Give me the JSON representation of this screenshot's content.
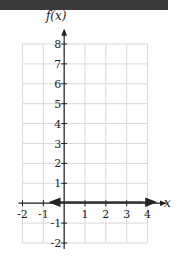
{
  "chart_data": {
    "type": "line",
    "title": "",
    "xlabel": "x",
    "ylabel": "f(x)",
    "xlim": [
      -2,
      4
    ],
    "ylim": [
      -2,
      8
    ],
    "grid": true,
    "x_ticks": [
      "-2",
      "-1",
      "1",
      "2",
      "3",
      "4"
    ],
    "y_ticks": [
      "-2",
      "-1",
      "1",
      "2",
      "3",
      "4",
      "5",
      "6",
      "7",
      "8"
    ],
    "series": [
      {
        "name": "f(x)",
        "function": "4*(0.3)^x",
        "x": [
          -0.7,
          -0.5,
          -0.33,
          -0.2,
          0,
          0.5,
          1,
          1.5,
          2,
          2.5,
          3,
          3.5,
          4,
          4.3
        ],
        "values": [
          9.3,
          7.3,
          5.96,
          5.09,
          4,
          2.19,
          1.2,
          0.66,
          0.36,
          0.2,
          0.11,
          0.06,
          0.03,
          0.02
        ]
      }
    ],
    "annotations": [
      "arrow at upper-left end of curve",
      "arrow at right end of curve along x-axis"
    ]
  },
  "labels": {
    "y_axis": "f(x)",
    "x_axis": "x"
  },
  "colors": {
    "curve": "#333333",
    "grid": "#d9d9d9",
    "axis": "#222222",
    "topbar": "#3a3a3a"
  }
}
